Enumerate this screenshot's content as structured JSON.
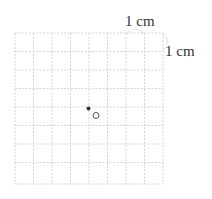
{
  "diagram": {
    "grid": {
      "cols": 8,
      "rows": 8,
      "line_color": "#c8c8c8",
      "style": "dashed"
    },
    "labels": {
      "top": "1 cm",
      "right": "1 cm"
    },
    "points": [
      {
        "name": "filled-dot",
        "type": "filled"
      },
      {
        "name": "open-circle",
        "type": "open"
      }
    ]
  }
}
